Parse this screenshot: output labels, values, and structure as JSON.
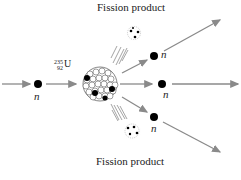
{
  "diagram": {
    "type": "nuclear fission",
    "labels": {
      "top_product": "Fission product",
      "bottom_product": "Fission product",
      "neutron": "n",
      "isotope_mass": "235",
      "isotope_atomic": "92",
      "isotope_symbol": "U"
    },
    "colors": {
      "arrow": "#8a8a8a",
      "particle": "#000000",
      "text": "#222222"
    },
    "neutrons": [
      {
        "role": "incoming",
        "label": "n"
      },
      {
        "role": "outgoing-upper",
        "label": "n"
      },
      {
        "role": "outgoing-middle",
        "label": "n"
      },
      {
        "role": "outgoing-lower",
        "label": "n"
      }
    ]
  }
}
